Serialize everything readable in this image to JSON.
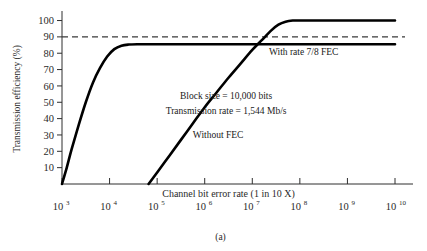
{
  "figure": {
    "caption": "(a)",
    "background_color": "#ffffff",
    "curve_color": "#000000",
    "axis_color": "#2e2e2e",
    "reference_line_color": "#3a3a3a"
  },
  "chart_data": {
    "type": "line",
    "title": "",
    "xlabel": "Channel bit error rate (1 in 10 X)",
    "ylabel": "Transmission efficiency (%)",
    "xscale": "log-exponent",
    "xlim": [
      3,
      10
    ],
    "ylim": [
      0,
      104
    ],
    "grid": false,
    "legend_position": "inline-annotation",
    "x_tick_bases": [
      "10",
      "10",
      "10",
      "10",
      "10",
      "10",
      "10",
      "10"
    ],
    "x_tick_exponents": [
      "3",
      "4",
      "5",
      "6",
      "7",
      "8",
      "9",
      "10"
    ],
    "x_ticks": [
      3,
      4,
      5,
      6,
      7,
      8,
      9,
      10
    ],
    "y_ticks": [
      10,
      20,
      30,
      40,
      50,
      60,
      70,
      80,
      90,
      100
    ],
    "y_tick_labels": [
      "10",
      "20",
      "30",
      "40",
      "50",
      "60",
      "70",
      "80",
      "90",
      "100"
    ],
    "series": [
      {
        "name": "With rate 7/8 FEC",
        "label": "With rate 7/8 FEC",
        "label_x": 7.35,
        "label_y": 79,
        "plateau": 85.5,
        "x": [
          3.0,
          3.1,
          3.2,
          3.35,
          3.5,
          3.65,
          3.8,
          3.95,
          4.1,
          4.25,
          4.4,
          4.6,
          4.8,
          5.0,
          5.5,
          6.0,
          6.5,
          7.0,
          7.5,
          8.0,
          8.5,
          9.0,
          9.5,
          10.0
        ],
        "y": [
          0,
          10,
          21,
          36,
          50,
          62,
          71,
          78,
          82.5,
          84.6,
          85.3,
          85.5,
          85.5,
          85.5,
          85.5,
          85.5,
          85.5,
          85.5,
          85.5,
          85.5,
          85.5,
          85.5,
          85.5,
          85.5
        ]
      },
      {
        "name": "Without FEC",
        "label": "Without FEC",
        "label_x": 5.75,
        "label_y": 28,
        "plateau": 100,
        "x": [
          4.82,
          5.0,
          5.25,
          5.5,
          5.75,
          6.0,
          6.25,
          6.5,
          6.75,
          7.0,
          7.2,
          7.4,
          7.55,
          7.7,
          7.85,
          8.0,
          8.5,
          9.0,
          9.5,
          10.0
        ],
        "y": [
          0,
          7,
          17,
          27,
          37,
          47,
          56,
          65,
          73.5,
          82,
          88,
          94,
          97.5,
          99.3,
          100,
          100,
          100,
          100,
          100,
          100
        ]
      }
    ],
    "reference_line": {
      "name": "ninety-percent-reference",
      "y": 90,
      "style": "dashed",
      "spans_full_width": true
    },
    "annotations": [
      {
        "name": "block-size-note",
        "text": "Block size = 10,000 bits",
        "x": 6.45,
        "y": 52
      },
      {
        "name": "transmission-rate-note",
        "text": "Transmission rate = 1,544 Mb/s",
        "x": 6.45,
        "y": 43
      }
    ]
  }
}
